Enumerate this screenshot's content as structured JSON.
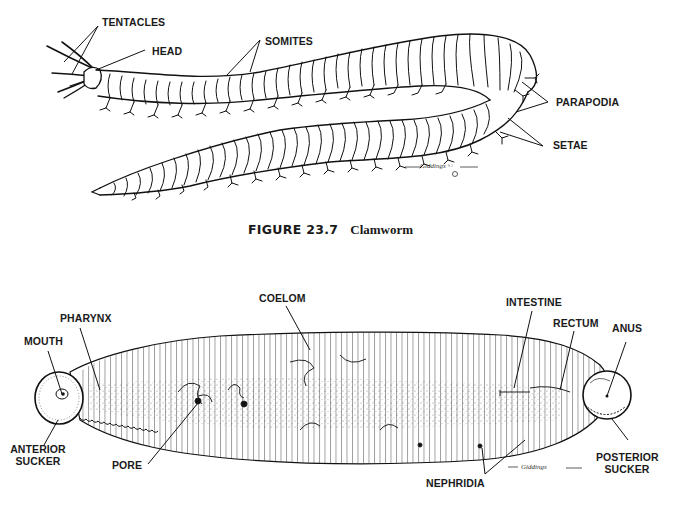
{
  "figure_top": {
    "subject": "Clamworm",
    "labels": {
      "tentacles": "TENTACLES",
      "head": "HEAD",
      "somites": "SOMITES",
      "parapodia": "PARAPODIA",
      "setae": "SETAE"
    },
    "caption": {
      "number": "FIGURE 23.7",
      "title": "Clamworm"
    },
    "signature": "Giddings ©"
  },
  "figure_bottom": {
    "subject": "Leech",
    "labels": {
      "mouth": "MOUTH",
      "pharynx": "PHARYNX",
      "coelom": "COELOM",
      "intestine": "INTESTINE",
      "rectum": "RECTUM",
      "anus": "ANUS",
      "anterior_sucker_1": "ANTERIOR",
      "anterior_sucker_2": "SUCKER",
      "pore": "PORE",
      "nephridia": "NEPHRIDIA",
      "posterior_sucker_1": "POSTERIOR",
      "posterior_sucker_2": "SUCKER"
    },
    "signature": "Giddings"
  }
}
